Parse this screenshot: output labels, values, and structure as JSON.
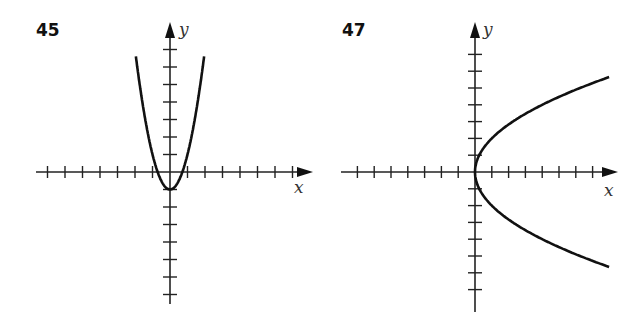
{
  "chart_data": [
    {
      "id": "45",
      "type": "line",
      "title": "45",
      "xlabel": "x",
      "ylabel": "y",
      "equation": "y = 2x^2 - 1",
      "xlim": [
        -8,
        8
      ],
      "ylim": [
        -8,
        9
      ],
      "grid": false,
      "tick_spacing": 1,
      "vertex": [
        0,
        -1
      ],
      "x_intercepts": [
        -0.7,
        0.7
      ],
      "series": [
        {
          "name": "curve",
          "x": [
            -2.0,
            -1.5,
            -1.0,
            -0.5,
            0,
            0.5,
            1.0,
            1.5,
            2.0
          ],
          "y": [
            7.0,
            3.5,
            1.0,
            -0.5,
            -1.0,
            -0.5,
            1.0,
            3.5,
            7.0
          ]
        }
      ]
    },
    {
      "id": "47",
      "type": "line",
      "title": "47",
      "xlabel": "x",
      "ylabel": "y",
      "equation": "x = y^2 / 4",
      "xlim": [
        -8,
        8
      ],
      "ylim": [
        -8,
        9
      ],
      "grid": false,
      "tick_spacing": 1,
      "vertex": [
        0,
        0
      ],
      "series": [
        {
          "name": "curve",
          "x": [
            7.8,
            4.0,
            2.25,
            1.0,
            0.25,
            0,
            0.25,
            1.0,
            2.25,
            4.0,
            7.8
          ],
          "y": [
            -5.6,
            -4,
            -3,
            -2,
            -1,
            0,
            1,
            2,
            3,
            4,
            5.6
          ]
        }
      ]
    }
  ],
  "panels": [
    {
      "number": "45",
      "x_axis_label": "x",
      "y_axis_label": "y"
    },
    {
      "number": "47",
      "x_axis_label": "x",
      "y_axis_label": "y"
    }
  ],
  "colors": {
    "ink": "#111111",
    "axis_label": "#333333",
    "background": "#ffffff"
  }
}
